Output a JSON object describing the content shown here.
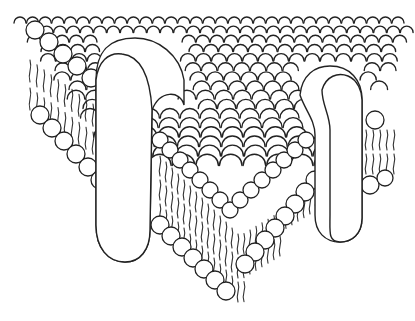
{
  "figure": {
    "style": "black line drawing on white",
    "colors": {
      "background": "#ffffff",
      "ink": "#222222"
    },
    "elements": {
      "lipid_heads": "circles forming top surface and edges of bilayer",
      "lipid_tails": "wavy vertical lines between head layers",
      "proteins": [
        {
          "id": "left-protein",
          "position": "left, spanning bilayer"
        },
        {
          "id": "right-protein",
          "position": "right, spanning bilayer"
        }
      ]
    }
  }
}
